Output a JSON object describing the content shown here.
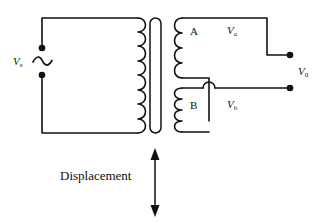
{
  "figure": {
    "width": 320,
    "height": 223,
    "stroke_color": "#111111",
    "background_color": "#ffffff"
  },
  "labels": {
    "source": {
      "symbol": "V",
      "subscript": "s",
      "name": "excitation-source-voltage"
    },
    "coil_a": {
      "text": "A",
      "name": "secondary-coil-a"
    },
    "coil_b": {
      "text": "B",
      "name": "secondary-coil-b"
    },
    "voltage_a": {
      "symbol": "V",
      "subscript": "a",
      "name": "secondary-a-voltage"
    },
    "voltage_b": {
      "symbol": "V",
      "subscript": "b",
      "name": "secondary-b-voltage"
    },
    "voltage_out": {
      "symbol": "V",
      "subscript": "0",
      "name": "output-voltage"
    },
    "displacement": {
      "text": "Displacement",
      "name": "displacement-label"
    }
  },
  "components": {
    "ac_source": {
      "name": "ac-source-symbol",
      "glyph": "sine-wave"
    },
    "primary_coil": {
      "name": "primary-coil",
      "turns": 8
    },
    "core": {
      "name": "movable-core",
      "shape": "stadium"
    },
    "secondary_coil_a": {
      "name": "secondary-coil-a-winding",
      "turns": 4
    },
    "secondary_coil_b": {
      "name": "secondary-coil-b-winding",
      "turns": 4
    },
    "wire_hop": {
      "name": "wire-crossover-hop"
    },
    "terminals": [
      {
        "name": "source-terminal-top"
      },
      {
        "name": "source-terminal-bottom"
      },
      {
        "name": "output-terminal-top"
      },
      {
        "name": "output-terminal-bottom"
      }
    ],
    "displacement_arrow": {
      "name": "displacement-double-arrow",
      "direction": "vertical-bidirectional"
    }
  }
}
